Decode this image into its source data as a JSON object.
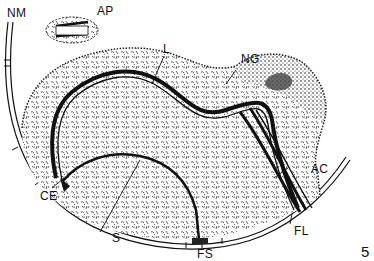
{
  "figure": {
    "number": "5",
    "style": "black-and-white line illustration",
    "ink_color": "#111111",
    "background_color": "#ffffff"
  },
  "labels": [
    {
      "id": "NM",
      "text": "NM"
    },
    {
      "id": "AP",
      "text": "AP"
    },
    {
      "id": "L",
      "text": "L"
    },
    {
      "id": "NG",
      "text": "NG"
    },
    {
      "id": "AC",
      "text": "AC"
    },
    {
      "id": "CE",
      "text": "CE"
    },
    {
      "id": "S",
      "text": "S"
    },
    {
      "id": "FS",
      "text": "FS"
    },
    {
      "id": "FL",
      "text": "FL"
    }
  ]
}
